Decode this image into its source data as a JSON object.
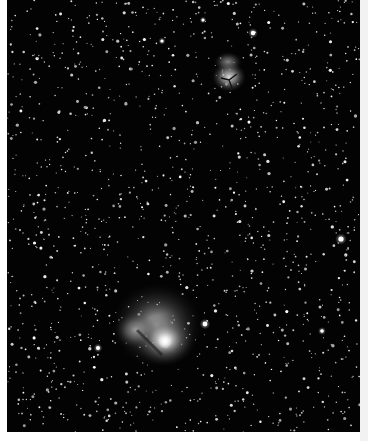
{
  "image": {
    "subject": "star field astrophotograph",
    "description": "Dense star field with two emission nebulae",
    "background_color": "#030303",
    "frame_color": "#ffffff",
    "objects": [
      {
        "name": "upper-nebula",
        "cx": 228,
        "cy": 70,
        "r": 16,
        "brightness": 0.75
      },
      {
        "name": "lower-nebula",
        "cx": 150,
        "cy": 335,
        "r": 40,
        "brightness": 0.95
      }
    ],
    "bright_stars": [
      {
        "cx": 253,
        "cy": 33,
        "r": 2.2
      },
      {
        "cx": 341,
        "cy": 239,
        "r": 2.6
      },
      {
        "cx": 205,
        "cy": 324,
        "r": 2.4
      },
      {
        "cx": 98,
        "cy": 348,
        "r": 2.0
      },
      {
        "cx": 322,
        "cy": 331,
        "r": 1.8
      },
      {
        "cx": 162,
        "cy": 41,
        "r": 1.6
      },
      {
        "cx": 203,
        "cy": 20,
        "r": 1.5
      }
    ]
  }
}
